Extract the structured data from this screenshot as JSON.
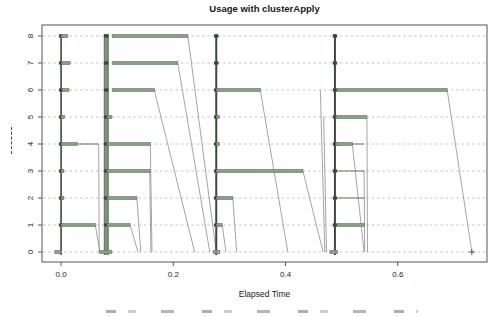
{
  "chart_data": {
    "type": "timeline",
    "title": "Usage with clusterApply",
    "xlabel": "Elapsed Time",
    "ylabel_visible_as": "tiny illegible vertical dashes",
    "x_ticks": [
      0.0,
      0.2,
      0.4,
      0.6
    ],
    "x_tick_labels": [
      "0.0",
      "0.2",
      "0.4",
      "0.6"
    ],
    "y_ticks": [
      0,
      1,
      2,
      3,
      4,
      5,
      6,
      7,
      8
    ],
    "y_tick_labels": [
      "0",
      "1",
      "2",
      "3",
      "4",
      "5",
      "6",
      "7",
      "8"
    ],
    "xlim": [
      -0.034,
      0.759
    ],
    "grid": "dashed horizontal idle lines per node",
    "legend": "none",
    "nodes": [
      {
        "node": 8,
        "segments": [
          [
            0.0,
            0.012,
            3
          ],
          [
            0.091,
            0.226,
            3
          ]
        ]
      },
      {
        "node": 7,
        "segments": [
          [
            0.001,
            0.016,
            3
          ],
          [
            0.091,
            0.208,
            3
          ]
        ]
      },
      {
        "node": 6,
        "segments": [
          [
            0.002,
            0.014,
            3
          ],
          [
            0.091,
            0.166,
            3
          ],
          [
            0.2765,
            0.355,
            3
          ],
          [
            0.492,
            0.688,
            3
          ]
        ]
      },
      {
        "node": 5,
        "segments": [
          [
            0.0,
            0.006,
            3
          ],
          [
            0.082,
            0.0905,
            3
          ],
          [
            0.2765,
            0.282,
            3
          ],
          [
            0.49,
            0.545,
            3
          ]
        ]
      },
      {
        "node": 4,
        "segments": [
          [
            0.0,
            0.029,
            3
          ],
          [
            0.029,
            0.067,
            1
          ],
          [
            0.082,
            0.159,
            3
          ],
          [
            0.2765,
            0.282,
            3
          ],
          [
            0.49,
            0.519,
            3
          ],
          [
            0.519,
            0.54,
            1
          ]
        ]
      },
      {
        "node": 3,
        "segments": [
          [
            0.0,
            0.005,
            3
          ],
          [
            0.082,
            0.159,
            3
          ],
          [
            0.2765,
            0.431,
            3
          ],
          [
            0.492,
            0.541,
            1
          ]
        ]
      },
      {
        "node": 2,
        "segments": [
          [
            0.0,
            0.005,
            3
          ],
          [
            0.082,
            0.135,
            3
          ],
          [
            0.2765,
            0.306,
            3
          ],
          [
            0.492,
            0.541,
            1
          ]
        ]
      },
      {
        "node": 1,
        "segments": [
          [
            0.0,
            0.061,
            3
          ],
          [
            0.082,
            0.123,
            3
          ],
          [
            0.2765,
            0.287,
            3
          ],
          [
            0.492,
            0.541,
            3
          ]
        ]
      },
      {
        "node": 0,
        "segments": [
          [
            -0.011,
            0.001,
            3
          ],
          [
            0.068,
            0.0905,
            3
          ],
          [
            0.271,
            0.283,
            3
          ],
          [
            0.479,
            0.493,
            3
          ]
        ]
      }
    ],
    "send_events": [
      {
        "t": 0.0,
        "w": 1.6,
        "style": "line"
      },
      {
        "t": 0.0805,
        "w": 4,
        "style": "band"
      },
      {
        "t": 0.2765,
        "w": 2,
        "style": "line"
      },
      {
        "t": 0.488,
        "w": 2,
        "style": "line"
      }
    ],
    "recv_lines": [
      [
        0.061,
        1,
        0.069
      ],
      [
        0.067,
        4,
        0.068
      ],
      [
        0.123,
        1,
        0.137
      ],
      [
        0.135,
        2,
        0.142
      ],
      [
        0.158,
        3,
        0.16
      ],
      [
        0.159,
        4,
        0.162
      ],
      [
        0.166,
        6,
        0.238
      ],
      [
        0.208,
        7,
        0.265
      ],
      [
        0.226,
        8,
        0.2765
      ],
      [
        0.287,
        1,
        0.294
      ],
      [
        0.306,
        2,
        0.313
      ],
      [
        0.355,
        6,
        0.404
      ],
      [
        0.431,
        3,
        0.467
      ],
      [
        0.462,
        6,
        0.47
      ],
      [
        0.468,
        5,
        0.473
      ],
      [
        0.519,
        4,
        0.54
      ],
      [
        0.54,
        3,
        0.541
      ],
      [
        0.545,
        5,
        0.546
      ],
      [
        0.688,
        6,
        0.732
      ]
    ],
    "end_marker": {
      "t": 0.732,
      "node": 0
    },
    "layout": {
      "plot": {
        "left": 42,
        "right": 487,
        "top": 25,
        "bottom": 262
      },
      "y0_px": 252,
      "row_dy_px": 27,
      "canvas": {
        "width": 497,
        "height": 316
      }
    },
    "colors": {
      "bar": "#8a9e88",
      "bar_edge": "#62785f",
      "send": "#3d463d",
      "band": "#7d937d",
      "band_edge": "#4e5e4e",
      "comm": "#9a9a9a",
      "idle": "#bdbdbd",
      "frame": "#555555",
      "text": "#1a1a1a"
    }
  }
}
